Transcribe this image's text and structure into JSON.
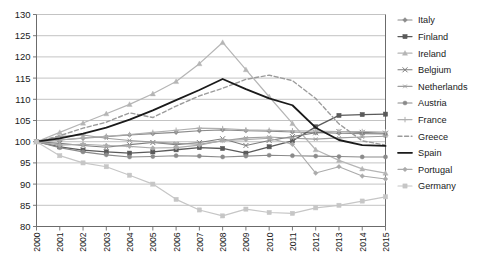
{
  "chart_data": {
    "type": "line",
    "title": "",
    "xlabel": "",
    "ylabel": "",
    "x": [
      2000,
      2001,
      2002,
      2003,
      2004,
      2005,
      2006,
      2007,
      2008,
      2009,
      2010,
      2011,
      2012,
      2013,
      2014,
      2015
    ],
    "categories": [
      "2000",
      "2001",
      "2002",
      "2003",
      "2004",
      "2005",
      "2006",
      "2007",
      "2008",
      "2009",
      "2010",
      "2011",
      "2012",
      "2013",
      "2014",
      "2015"
    ],
    "ylim": [
      80,
      130
    ],
    "yticks": [
      80,
      85,
      90,
      95,
      100,
      105,
      110,
      115,
      120,
      125,
      130
    ],
    "grid": true,
    "legend_position": "right",
    "series": [
      {
        "name": "Italy",
        "color": "#8c8c8c",
        "marker": "diamond",
        "dash": "none",
        "width": 1.1,
        "values": [
          100,
          100.4,
          100.8,
          101.2,
          101.6,
          101.9,
          102.2,
          102.6,
          102.8,
          102.6,
          102.5,
          102.3,
          102.1,
          102,
          101.9,
          101.8
        ]
      },
      {
        "name": "Finland",
        "color": "#5a5a5a",
        "marker": "square",
        "dash": "none",
        "width": 1.3,
        "values": [
          100,
          98.8,
          98,
          97.6,
          97.3,
          97.6,
          98.1,
          98.6,
          98.4,
          97.3,
          98.8,
          100.2,
          103.5,
          106.2,
          106.4,
          106.5
        ]
      },
      {
        "name": "Ireland",
        "color": "#b5b5b5",
        "marker": "triangle",
        "dash": "none",
        "width": 1.2,
        "values": [
          100,
          102.2,
          104.4,
          106.6,
          108.8,
          111.3,
          114.2,
          118.4,
          123.4,
          117,
          110.6,
          104.3,
          98.1,
          95.6,
          93.6,
          92.6
        ]
      },
      {
        "name": "Belgium",
        "color": "#7d7d7d",
        "marker": "cross",
        "dash": "none",
        "width": 1.1,
        "values": [
          100,
          99.6,
          99.1,
          98.7,
          99.3,
          99.8,
          99.3,
          99.8,
          100.7,
          99.1,
          100.3,
          101.2,
          102.1,
          102.4,
          102.2,
          102
        ]
      },
      {
        "name": "Netherlands",
        "color": "#9e9e9e",
        "marker": "asterisk",
        "dash": "none",
        "width": 1.1,
        "values": [
          100,
          101.2,
          101.6,
          100.8,
          100.3,
          99.9,
          99.6,
          99.4,
          100.2,
          100.9,
          101.1,
          100.8,
          100.6,
          100.9,
          101.1,
          101.3
        ]
      },
      {
        "name": "Austria",
        "color": "#8a8a8a",
        "marker": "circle",
        "dash": "none",
        "width": 1.1,
        "values": [
          100,
          98.6,
          97.6,
          96.9,
          96.4,
          96.5,
          96.7,
          96.6,
          96.4,
          96.6,
          96.8,
          96.7,
          96.6,
          96.5,
          96.4,
          96.4
        ]
      },
      {
        "name": "France",
        "color": "#b0b0b0",
        "marker": "plus",
        "dash": "none",
        "width": 1.1,
        "values": [
          100,
          100.4,
          100.9,
          101.3,
          101.7,
          102.2,
          102.7,
          103.2,
          103.1,
          102.8,
          102.7,
          102.6,
          102.5,
          102.4,
          102.4,
          102.3
        ]
      },
      {
        "name": "Greece",
        "color": "#9b9b9b",
        "marker": "none",
        "dash": "dashed",
        "width": 1.4,
        "values": [
          100,
          101.4,
          103.2,
          104.6,
          106.8,
          105.7,
          108.4,
          110.8,
          112.6,
          114.7,
          115.7,
          114.4,
          110.2,
          104.2,
          100.2,
          99.2
        ]
      },
      {
        "name": "Spain",
        "color": "#1a1a1a",
        "marker": "none",
        "dash": "none",
        "width": 1.8,
        "values": [
          100,
          100.8,
          101.9,
          103.3,
          105.2,
          107.4,
          109.8,
          112.2,
          114.8,
          112.4,
          110.2,
          108.6,
          103.3,
          100.4,
          99.2,
          99
        ]
      },
      {
        "name": "Portugal",
        "color": "#ababab",
        "marker": "diamond",
        "dash": "none",
        "width": 1.1,
        "values": [
          100,
          99.2,
          99.4,
          99.1,
          98.9,
          98.5,
          98.6,
          99.2,
          100.3,
          100.5,
          100.8,
          99.4,
          92.6,
          94.1,
          91.9,
          91.2
        ]
      },
      {
        "name": "Germany",
        "color": "#c6c6c6",
        "marker": "square",
        "dash": "none",
        "width": 1.2,
        "values": [
          100,
          96.7,
          95,
          94.1,
          92.1,
          90,
          86.4,
          83.9,
          82.5,
          84.1,
          83.3,
          83.1,
          84.4,
          85,
          86,
          87
        ]
      }
    ]
  },
  "axis": {
    "y_labels": [
      "130",
      "125",
      "120",
      "115",
      "110",
      "105",
      "100",
      "95",
      "90",
      "85",
      "80"
    ],
    "x_labels": [
      "2000",
      "2001",
      "2002",
      "2003",
      "2004",
      "2005",
      "2006",
      "2007",
      "2008",
      "2009",
      "2010",
      "2011",
      "2012",
      "2013",
      "2014",
      "2015"
    ]
  },
  "legend": {
    "items": [
      {
        "label": "Italy"
      },
      {
        "label": "Finland"
      },
      {
        "label": "Ireland"
      },
      {
        "label": "Belgium"
      },
      {
        "label": "Netherlands"
      },
      {
        "label": "Austria"
      },
      {
        "label": "France"
      },
      {
        "label": "Greece"
      },
      {
        "label": "Spain"
      },
      {
        "label": "Portugal"
      },
      {
        "label": "Germany"
      }
    ]
  }
}
